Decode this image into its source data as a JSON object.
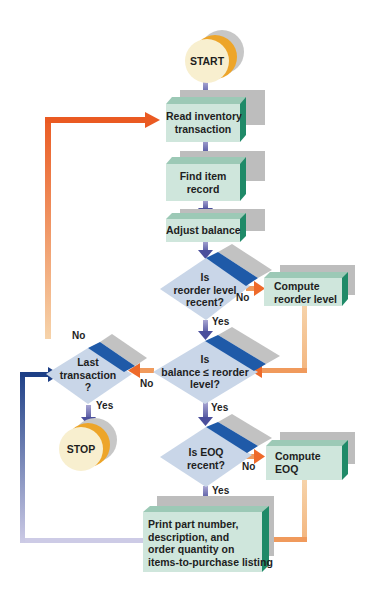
{
  "diagram": {
    "type": "flowchart",
    "colors": {
      "process_face": "#cfe6dc",
      "process_top": "#9cc9b6",
      "process_side": "#1f8a68",
      "shadow": "#bdbdbd",
      "decision_face": "#c9d6e8",
      "decision_band": "#1f5aa8",
      "terminal_face": "#f8efcf",
      "terminal_ring": "#eda52a",
      "arrow_flow": "#6b6fb2",
      "arrow_orange": "#ee6a2a",
      "arrow_orange_light": "#f5c89a",
      "arrow_navy": "#1d3f86",
      "arrow_lavender": "#c9c6e4"
    },
    "nodes": {
      "start": {
        "label": "START",
        "shape": "terminal"
      },
      "read": {
        "label_1": "Read inventory",
        "label_2": "transaction",
        "shape": "process"
      },
      "find": {
        "label_1": "Find item",
        "label_2": "record",
        "shape": "process"
      },
      "adjust": {
        "label": "Adjust balance",
        "shape": "process"
      },
      "reorder_recent": {
        "label_1": "Is",
        "label_2": "reorder level",
        "label_3": "recent?",
        "shape": "decision"
      },
      "compute_reorder": {
        "label_1": "Compute",
        "label_2": "reorder level",
        "shape": "process"
      },
      "balance_check": {
        "label_1": "Is",
        "label_2": "balance ≤ reorder",
        "label_3": "level?",
        "shape": "decision"
      },
      "last_transaction": {
        "label_1": "Last",
        "label_2": "transaction",
        "label_3": "?",
        "shape": "decision"
      },
      "stop": {
        "label": "STOP",
        "shape": "terminal"
      },
      "eoq_recent": {
        "label_1": "Is EOQ",
        "label_2": "recent?",
        "shape": "decision"
      },
      "compute_eoq": {
        "label_1": "Compute",
        "label_2": "EOQ",
        "shape": "process"
      },
      "print": {
        "label_1": "Print part number,",
        "label_2": "description, and",
        "label_3": "order quantity on",
        "label_4": "items-to-purchase listing",
        "shape": "process"
      }
    },
    "edge_labels": {
      "reorder_no": "No",
      "reorder_yes": "Yes",
      "balance_no": "No",
      "balance_yes": "Yes",
      "last_no": "No",
      "last_yes": "Yes",
      "eoq_no": "No",
      "eoq_yes": "Yes"
    },
    "edges": [
      [
        "start",
        "read",
        ""
      ],
      [
        "read",
        "find",
        ""
      ],
      [
        "find",
        "adjust",
        ""
      ],
      [
        "adjust",
        "reorder_recent",
        ""
      ],
      [
        "reorder_recent",
        "compute_reorder",
        "No"
      ],
      [
        "reorder_recent",
        "balance_check",
        "Yes"
      ],
      [
        "compute_reorder",
        "balance_check",
        ""
      ],
      [
        "balance_check",
        "last_transaction",
        "No"
      ],
      [
        "balance_check",
        "eoq_recent",
        "Yes"
      ],
      [
        "last_transaction",
        "read",
        "No"
      ],
      [
        "last_transaction",
        "stop",
        "Yes"
      ],
      [
        "eoq_recent",
        "compute_eoq",
        "No"
      ],
      [
        "eoq_recent",
        "print",
        "Yes"
      ],
      [
        "compute_eoq",
        "print",
        ""
      ],
      [
        "print",
        "last_transaction",
        ""
      ]
    ]
  }
}
